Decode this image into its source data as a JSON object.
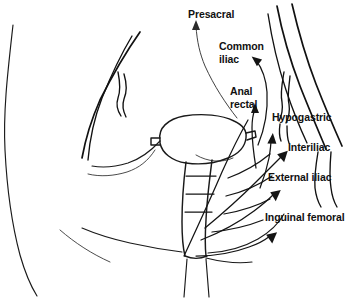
{
  "diagram": {
    "background_color": "#ffffff",
    "line_color": "#111111",
    "text_color": "#111111",
    "labels": [
      {
        "id": "presacral",
        "text": "Presacral",
        "x": 188,
        "y": 8,
        "lines": [
          "Presacral"
        ]
      },
      {
        "id": "common-iliac",
        "text": "Common iliac",
        "x": 219,
        "y": 40,
        "lines": [
          "Common",
          "iliac"
        ]
      },
      {
        "id": "anal-rectal",
        "text": "Anal rectal",
        "x": 230,
        "y": 85,
        "lines": [
          "Anal",
          "rectal"
        ]
      },
      {
        "id": "hypogastric",
        "text": "Hypogastric",
        "x": 272,
        "y": 111,
        "lines": [
          "Hypogastric"
        ]
      },
      {
        "id": "interiliac",
        "text": "Interiliac",
        "x": 288,
        "y": 141,
        "lines": [
          "Interiliac"
        ]
      },
      {
        "id": "external-iliac",
        "text": "External iliac",
        "x": 268,
        "y": 171,
        "lines": [
          "External iliac"
        ]
      },
      {
        "id": "inguinal-femoral",
        "text": "Inguinal femoral",
        "x": 265,
        "y": 211,
        "lines": [
          "Inguinal femoral"
        ]
      }
    ],
    "structures": [
      {
        "id": "left-body-wall",
        "name": "left body wall outline"
      },
      {
        "id": "left-vessel-pair",
        "name": "left iliac vessel pair"
      },
      {
        "id": "right-body-wall",
        "name": "right body wall outline"
      },
      {
        "id": "right-vessel-group",
        "name": "right iliac vessel group"
      },
      {
        "id": "bladder",
        "name": "bladder"
      },
      {
        "id": "urethra",
        "name": "urethra"
      },
      {
        "id": "lymphatic-flow",
        "name": "lymphatic drainage flow arrows"
      }
    ]
  }
}
